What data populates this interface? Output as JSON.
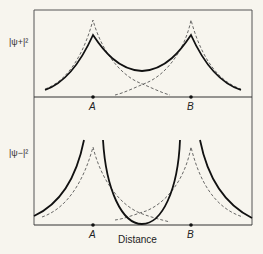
{
  "diagram": {
    "top_panel": {
      "ylabel": "|ψ+|²",
      "points": [
        "A",
        "B"
      ]
    },
    "bottom_panel": {
      "ylabel": "|ψ−|²",
      "points": [
        "A",
        "B"
      ],
      "xlabel": "Distance"
    },
    "colors": {
      "background": "#f7f5ee",
      "line": "#222222",
      "dashed": "#444444"
    }
  }
}
